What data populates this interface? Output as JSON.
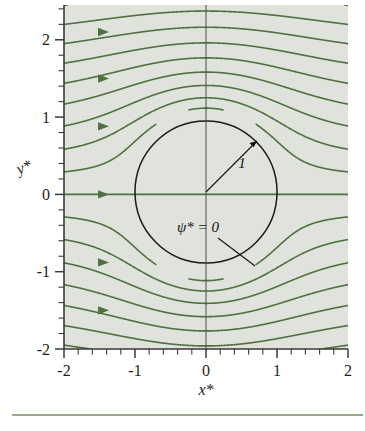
{
  "figure": {
    "background_color": "#ffffff",
    "plot_fill_color": "#dfe3dc",
    "streamline_color": "#4f7040",
    "cylinder_color": "#1a1a1a",
    "axis_color": "#3a3a3a",
    "rule_color": "#6f8f62"
  },
  "axes": {
    "x_title": "x*",
    "y_title": "y*",
    "x_ticks": [
      "-2",
      "-1",
      "0",
      "1",
      "2"
    ],
    "y_ticks": [
      "2",
      "1",
      "0",
      "-1",
      "-2"
    ],
    "x_tick_values": [
      -2,
      -1,
      0,
      1,
      2
    ],
    "y_tick_values": [
      2,
      1,
      0,
      -1,
      -2
    ],
    "x_minor_step": 0.2,
    "y_minor_step": 0.2,
    "xlim": [
      -2,
      2
    ],
    "ylim": [
      -2,
      2.45
    ]
  },
  "annotations": {
    "radius_label": "1",
    "streamfunction_label": "ψ* = 0"
  },
  "chart_data": {
    "type": "line",
    "title": "",
    "subtitle": "",
    "xlabel": "x*",
    "ylabel": "y*",
    "xlim": [
      -2,
      2
    ],
    "ylim": [
      -2,
      2.45
    ],
    "grid": false,
    "legend": "none",
    "model": {
      "name": "potential-flow-over-cylinder",
      "formula": "psi* = y*(1 - 1/(x*^2 + y*^2))",
      "cylinder_center": [
        0,
        0
      ],
      "cylinder_radius": 1,
      "freestream_direction": "+x"
    },
    "series": [
      {
        "name": "psi* = 2.20",
        "psi": 2.2
      },
      {
        "name": "psi* = 1.95",
        "psi": 1.95
      },
      {
        "name": "psi* = 1.70",
        "psi": 1.7
      },
      {
        "name": "psi* = 1.45",
        "psi": 1.45
      },
      {
        "name": "psi* = 1.20",
        "psi": 1.2
      },
      {
        "name": "psi* = 0.95",
        "psi": 0.95
      },
      {
        "name": "psi* = 0.70",
        "psi": 0.7
      },
      {
        "name": "psi* = 0.45",
        "psi": 0.45
      },
      {
        "name": "psi* = 0.22",
        "psi": 0.22
      },
      {
        "name": "psi* = 0",
        "psi": 0.0
      },
      {
        "name": "psi* = -0.22",
        "psi": -0.22
      },
      {
        "name": "psi* = -0.45",
        "psi": -0.45
      },
      {
        "name": "psi* = -0.70",
        "psi": -0.7
      },
      {
        "name": "psi* = -0.95",
        "psi": -0.95
      },
      {
        "name": "psi* = -1.20",
        "psi": -1.2
      },
      {
        "name": "psi* = -1.45",
        "psi": -1.45
      },
      {
        "name": "psi* = -1.70",
        "psi": -1.7
      },
      {
        "name": "psi* = -1.95",
        "psi": -1.95
      }
    ],
    "flow_arrow_y_values": [
      2.1,
      1.5,
      0.88,
      0.0,
      -0.88,
      -1.5
    ],
    "annotations": [
      {
        "text": "1",
        "kind": "radius-callout",
        "from": [
          0,
          0
        ],
        "to": [
          0.72,
          0.72
        ]
      },
      {
        "text": "ψ* = 0",
        "kind": "streamline-label",
        "at": [
          -0.28,
          -0.4
        ],
        "points_to": [
          0.7,
          -0.72
        ]
      }
    ]
  }
}
